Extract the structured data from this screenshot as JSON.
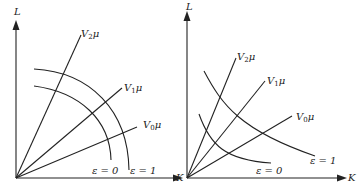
{
  "diagram": {
    "left_panel": {
      "y_axis_label": "L",
      "x_axis_label": "K",
      "rays": [
        {
          "label": "V",
          "sub": "2",
          "suffix": "μ"
        },
        {
          "label": "V",
          "sub": "1",
          "suffix": "μ"
        },
        {
          "label": "V",
          "sub": "0",
          "suffix": "μ"
        }
      ],
      "curves": [
        {
          "label": "ε = 0"
        },
        {
          "label": "ε = 1"
        }
      ]
    },
    "right_panel": {
      "y_axis_label": "L",
      "x_axis_label": "K",
      "rays": [
        {
          "label": "V",
          "sub": "2",
          "suffix": "μ"
        },
        {
          "label": "V",
          "sub": "1",
          "suffix": "μ"
        },
        {
          "label": "V",
          "sub": "0",
          "suffix": "μ"
        }
      ],
      "curves": [
        {
          "label": "ε = 0"
        },
        {
          "label": "ε = 1"
        }
      ]
    }
  }
}
